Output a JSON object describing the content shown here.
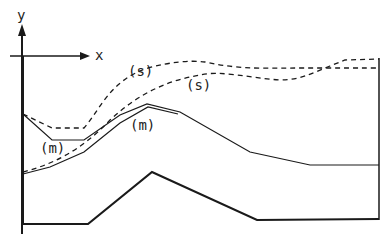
{
  "axes": {
    "y_label": "y",
    "x_label": "x"
  },
  "labels": {
    "surface_upper": "(s)",
    "surface_lower": "(s)",
    "middle_left": "(m)",
    "middle_center": "(m)"
  },
  "colors": {
    "line": "#1a1a1a",
    "background": "#ffffff"
  }
}
